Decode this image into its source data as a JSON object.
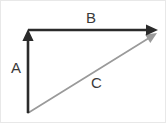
{
  "diagram": {
    "type": "vector-triangle",
    "background_color": "#ffffff",
    "border_color": "#e8e8e8",
    "width": 166,
    "height": 123,
    "vectors": [
      {
        "id": "a",
        "label": "A",
        "orientation": "vertical",
        "color": "#2b2b2b",
        "stroke_width": 2.6,
        "from": {
          "x": 27,
          "y": 112
        },
        "to": {
          "x": 27,
          "y": 28
        },
        "arrowhead": "end",
        "label_position": {
          "x": 10,
          "y": 59
        }
      },
      {
        "id": "b",
        "label": "B",
        "orientation": "horizontal",
        "color": "#2b2b2b",
        "stroke_width": 2.6,
        "from": {
          "x": 27,
          "y": 29
        },
        "to": {
          "x": 157,
          "y": 29
        },
        "arrowhead": "end",
        "label_position": {
          "x": 85,
          "y": 9
        }
      },
      {
        "id": "c",
        "label": "C",
        "orientation": "diagonal",
        "color": "#9a9a9a",
        "stroke_width": 1.7,
        "from": {
          "x": 27,
          "y": 112
        },
        "to": {
          "x": 156,
          "y": 32
        },
        "arrowhead": "end",
        "label_position": {
          "x": 90,
          "y": 74
        }
      }
    ]
  }
}
